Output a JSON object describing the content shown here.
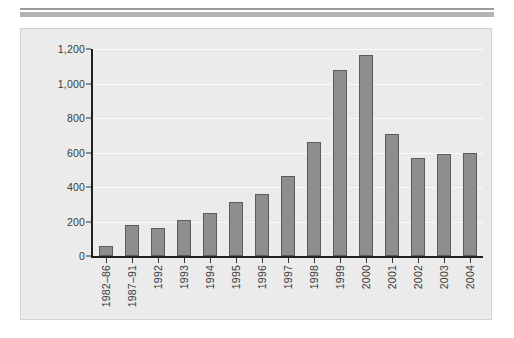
{
  "figure": {
    "panel_background": "#ebebeb",
    "panel_border": "#d2d2d2",
    "rule_thin_color": "#9a9a9a",
    "rule_thick_color": "#b3b3b3"
  },
  "chart_data": {
    "type": "bar",
    "title": "",
    "subtitle": "",
    "xlabel": "",
    "ylabel": "",
    "categories": [
      "1982–86",
      "1987–91",
      "1992",
      "1993",
      "1994",
      "1995",
      "1996",
      "1997",
      "1998",
      "1999",
      "2000",
      "2001",
      "2002",
      "2003",
      "2004"
    ],
    "values": [
      58,
      180,
      162,
      208,
      249,
      313,
      360,
      464,
      661,
      1078,
      1165,
      707,
      568,
      591,
      597
    ],
    "ylim": [
      0,
      1200
    ],
    "yticks": [
      0,
      200,
      400,
      600,
      800,
      1000,
      1200
    ],
    "ytick_labels": [
      "0",
      "200",
      "400",
      "600",
      "800",
      "1,000",
      "1,200"
    ],
    "grid": true,
    "grid_axis": "y",
    "grid_color": "#fbfbfb",
    "legend": false,
    "legend_position": "none",
    "bar_color": "#8e8e8e",
    "bar_edge_color": "#5c5c5c",
    "axis_color": "#1f1f1f",
    "tick_label_color": "#3a3a3a",
    "xtick_label_rotation": 90
  }
}
